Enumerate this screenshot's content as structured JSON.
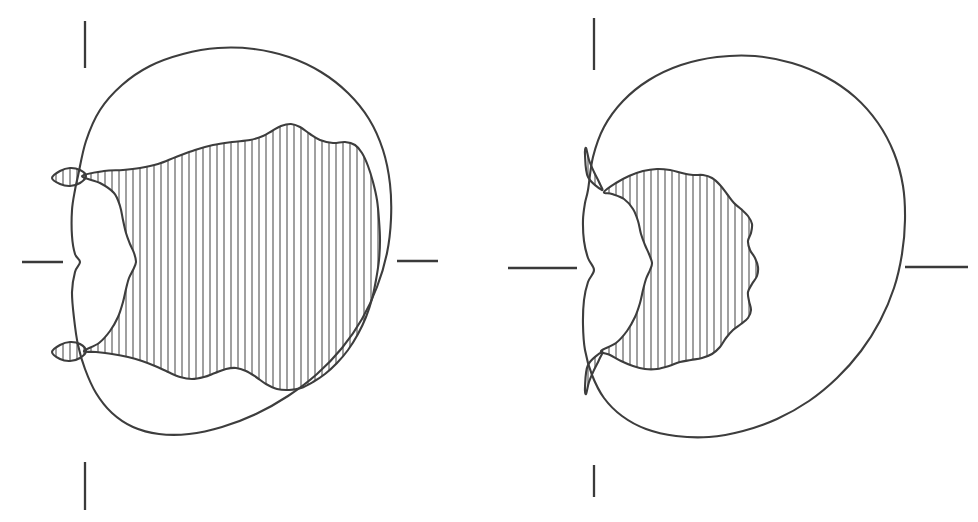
{
  "figure": {
    "title": "",
    "caption": "",
    "background_color": "#ffffff",
    "stroke_color": "#3d3d3d",
    "hatch_color": "#4a4a4a",
    "panel_count": 2,
    "panels": [
      {
        "id": "left-panel",
        "label": "",
        "center": {
          "x": 228,
          "y": 262
        },
        "outer_shape": "cardioid-like closed curve with left cusp",
        "inner_shape": "hatched wavy region filling most of the right interior",
        "hatch_style": "vertical-lines",
        "hatch_spacing_px": 7,
        "hatch_line_width_px": 1,
        "ticks": [
          {
            "name": "top",
            "orientation": "vertical",
            "x": 85,
            "y1": 21,
            "y2": 68
          },
          {
            "name": "left",
            "orientation": "horizontal",
            "y": 262,
            "x1": 22,
            "x2": 63
          },
          {
            "name": "right",
            "orientation": "horizontal",
            "y": 261,
            "x1": 397,
            "x2": 438
          },
          {
            "name": "bottom",
            "orientation": "vertical",
            "x": 85,
            "y1": 462,
            "y2": 510
          }
        ],
        "pinch_points": [
          {
            "name": "upper-lens",
            "x": 68,
            "y": 177
          },
          {
            "name": "left-cusp",
            "x": 75,
            "y": 263
          },
          {
            "name": "lower-lens",
            "x": 68,
            "y": 351
          }
        ]
      },
      {
        "id": "right-panel",
        "label": "",
        "center": {
          "x": 735,
          "y": 268
        },
        "outer_shape": "cardioid-like closed curve with left cusp",
        "inner_shape": "smaller hatched wavy blob plus two hatched wedges at the pinch points",
        "hatch_style": "vertical-lines",
        "hatch_spacing_px": 7,
        "hatch_line_width_px": 1,
        "ticks": [
          {
            "name": "top",
            "orientation": "vertical",
            "x": 594,
            "y1": 18,
            "y2": 70
          },
          {
            "name": "left",
            "orientation": "horizontal",
            "y": 268,
            "x1": 508,
            "x2": 577
          },
          {
            "name": "right",
            "orientation": "horizontal",
            "y": 267,
            "x1": 905,
            "x2": 968
          },
          {
            "name": "bottom",
            "orientation": "vertical",
            "x": 594,
            "y1": 465,
            "y2": 497
          }
        ],
        "pinch_points": [
          {
            "name": "upper-wedge-tip",
            "x": 602,
            "y": 190
          },
          {
            "name": "left-cusp",
            "x": 585,
            "y": 268
          },
          {
            "name": "lower-wedge-tip",
            "x": 602,
            "y": 352
          }
        ]
      }
    ]
  },
  "chart_data": {
    "type": "diagram",
    "title": "",
    "xlabel": "",
    "ylabel": "",
    "series": [
      {
        "name": "left-outer-boundary",
        "panel": "left-panel",
        "closed": true,
        "points": [
          [
            78,
            176
          ],
          [
            86,
            141
          ],
          [
            100,
            110
          ],
          [
            122,
            85
          ],
          [
            150,
            66
          ],
          [
            183,
            54
          ],
          [
            218,
            48
          ],
          [
            254,
            49
          ],
          [
            289,
            57
          ],
          [
            321,
            72
          ],
          [
            348,
            93
          ],
          [
            369,
            119
          ],
          [
            383,
            150
          ],
          [
            390,
            184
          ],
          [
            391,
            219
          ],
          [
            387,
            253
          ],
          [
            377,
            287
          ],
          [
            362,
            319
          ],
          [
            342,
            348
          ],
          [
            317,
            374
          ],
          [
            288,
            396
          ],
          [
            256,
            414
          ],
          [
            222,
            427
          ],
          [
            189,
            434
          ],
          [
            159,
            434
          ],
          [
            133,
            427
          ],
          [
            112,
            413
          ],
          [
            96,
            393
          ],
          [
            85,
            369
          ],
          [
            78,
            345
          ],
          [
            74,
            318
          ],
          [
            72,
            292
          ],
          [
            75,
            272
          ],
          [
            80,
            262
          ],
          [
            75,
            254
          ],
          [
            72,
            236
          ],
          [
            72,
            210
          ],
          [
            75,
            190
          ]
        ]
      },
      {
        "name": "left-inner-hatched-boundary",
        "panel": "left-panel",
        "closed": true,
        "points": [
          [
            82,
            176
          ],
          [
            104,
            171
          ],
          [
            123,
            170
          ],
          [
            140,
            168
          ],
          [
            158,
            164
          ],
          [
            176,
            157
          ],
          [
            195,
            150
          ],
          [
            213,
            145
          ],
          [
            232,
            142
          ],
          [
            250,
            140
          ],
          [
            263,
            136
          ],
          [
            272,
            131
          ],
          [
            281,
            126
          ],
          [
            291,
            124
          ],
          [
            300,
            127
          ],
          [
            310,
            134
          ],
          [
            320,
            140
          ],
          [
            333,
            143
          ],
          [
            345,
            142
          ],
          [
            355,
            145
          ],
          [
            362,
            153
          ],
          [
            368,
            166
          ],
          [
            373,
            182
          ],
          [
            377,
            200
          ],
          [
            379,
            220
          ],
          [
            380,
            240
          ],
          [
            379,
            260
          ],
          [
            376,
            280
          ],
          [
            372,
            299
          ],
          [
            366,
            317
          ],
          [
            358,
            334
          ],
          [
            348,
            350
          ],
          [
            337,
            363
          ],
          [
            325,
            374
          ],
          [
            313,
            382
          ],
          [
            301,
            388
          ],
          [
            289,
            390
          ],
          [
            277,
            389
          ],
          [
            266,
            384
          ],
          [
            256,
            377
          ],
          [
            246,
            371
          ],
          [
            236,
            368
          ],
          [
            226,
            369
          ],
          [
            215,
            373
          ],
          [
            204,
            377
          ],
          [
            192,
            379
          ],
          [
            180,
            377
          ],
          [
            168,
            372
          ],
          [
            155,
            366
          ],
          [
            142,
            361
          ],
          [
            128,
            357
          ],
          [
            112,
            354
          ],
          [
            96,
            352
          ],
          [
            84,
            351
          ],
          [
            99,
            343
          ],
          [
            110,
            331
          ],
          [
            118,
            317
          ],
          [
            123,
            302
          ],
          [
            126,
            289
          ],
          [
            129,
            278
          ],
          [
            133,
            270
          ],
          [
            136,
            262
          ],
          [
            134,
            253
          ],
          [
            130,
            244
          ],
          [
            126,
            233
          ],
          [
            123,
            220
          ],
          [
            120,
            206
          ],
          [
            114,
            193
          ],
          [
            100,
            183
          ]
        ]
      },
      {
        "name": "left-upper-lens",
        "panel": "left-panel",
        "closed": true,
        "points": [
          [
            52,
            178
          ],
          [
            60,
            171
          ],
          [
            70,
            168
          ],
          [
            80,
            170
          ],
          [
            86,
            176
          ],
          [
            80,
            183
          ],
          [
            70,
            186
          ],
          [
            60,
            184
          ]
        ]
      },
      {
        "name": "left-lower-lens",
        "panel": "left-panel",
        "closed": true,
        "points": [
          [
            52,
            352
          ],
          [
            60,
            345
          ],
          [
            70,
            342
          ],
          [
            80,
            344
          ],
          [
            86,
            351
          ],
          [
            80,
            358
          ],
          [
            70,
            361
          ],
          [
            60,
            359
          ]
        ]
      },
      {
        "name": "right-outer-boundary",
        "panel": "right-panel",
        "closed": true,
        "points": [
          [
            588,
            190
          ],
          [
            593,
            157
          ],
          [
            604,
            127
          ],
          [
            623,
            101
          ],
          [
            649,
            80
          ],
          [
            681,
            65
          ],
          [
            717,
            57
          ],
          [
            755,
            56
          ],
          [
            792,
            63
          ],
          [
            826,
            77
          ],
          [
            855,
            97
          ],
          [
            878,
            123
          ],
          [
            894,
            153
          ],
          [
            903,
            186
          ],
          [
            905,
            220
          ],
          [
            902,
            254
          ],
          [
            894,
            288
          ],
          [
            880,
            321
          ],
          [
            861,
            351
          ],
          [
            837,
            378
          ],
          [
            809,
            401
          ],
          [
            777,
            419
          ],
          [
            743,
            431
          ],
          [
            709,
            437
          ],
          [
            676,
            436
          ],
          [
            646,
            429
          ],
          [
            622,
            416
          ],
          [
            604,
            398
          ],
          [
            592,
            375
          ],
          [
            585,
            350
          ],
          [
            583,
            325
          ],
          [
            584,
            300
          ],
          [
            588,
            282
          ],
          [
            594,
            270
          ],
          [
            588,
            258
          ],
          [
            584,
            241
          ],
          [
            583,
            220
          ],
          [
            585,
            203
          ]
        ]
      },
      {
        "name": "right-inner-hatched-blob",
        "panel": "right-panel",
        "closed": true,
        "points": [
          [
            604,
            192
          ],
          [
            616,
            183
          ],
          [
            629,
            176
          ],
          [
            643,
            171
          ],
          [
            657,
            169
          ],
          [
            670,
            170
          ],
          [
            682,
            173
          ],
          [
            693,
            175
          ],
          [
            703,
            175
          ],
          [
            712,
            178
          ],
          [
            720,
            185
          ],
          [
            727,
            194
          ],
          [
            734,
            203
          ],
          [
            741,
            209
          ],
          [
            748,
            216
          ],
          [
            752,
            224
          ],
          [
            751,
            233
          ],
          [
            748,
            241
          ],
          [
            750,
            250
          ],
          [
            755,
            258
          ],
          [
            758,
            267
          ],
          [
            757,
            276
          ],
          [
            752,
            284
          ],
          [
            748,
            292
          ],
          [
            749,
            301
          ],
          [
            751,
            310
          ],
          [
            748,
            318
          ],
          [
            741,
            324
          ],
          [
            733,
            330
          ],
          [
            726,
            338
          ],
          [
            720,
            347
          ],
          [
            712,
            354
          ],
          [
            702,
            358
          ],
          [
            691,
            360
          ],
          [
            680,
            362
          ],
          [
            669,
            366
          ],
          [
            657,
            369
          ],
          [
            645,
            369
          ],
          [
            633,
            366
          ],
          [
            621,
            361
          ],
          [
            610,
            355
          ],
          [
            601,
            351
          ],
          [
            616,
            343
          ],
          [
            627,
            331
          ],
          [
            635,
            317
          ],
          [
            640,
            303
          ],
          [
            643,
            290
          ],
          [
            646,
            279
          ],
          [
            650,
            270
          ],
          [
            652,
            263
          ],
          [
            649,
            254
          ],
          [
            645,
            245
          ],
          [
            641,
            234
          ],
          [
            638,
            221
          ],
          [
            633,
            209
          ],
          [
            624,
            199
          ],
          [
            612,
            194
          ]
        ]
      },
      {
        "name": "right-upper-wedge",
        "panel": "right-panel",
        "closed": true,
        "points": [
          [
            602,
            190
          ],
          [
            588,
            177
          ],
          [
            585,
            155
          ],
          [
            586,
            148
          ],
          [
            589,
            160
          ],
          [
            594,
            172
          ],
          [
            599,
            182
          ]
        ]
      },
      {
        "name": "right-lower-wedge",
        "panel": "right-panel",
        "closed": true,
        "points": [
          [
            602,
            352
          ],
          [
            588,
            365
          ],
          [
            585,
            387
          ],
          [
            586,
            394
          ],
          [
            589,
            382
          ],
          [
            594,
            370
          ],
          [
            599,
            360
          ]
        ]
      }
    ]
  }
}
